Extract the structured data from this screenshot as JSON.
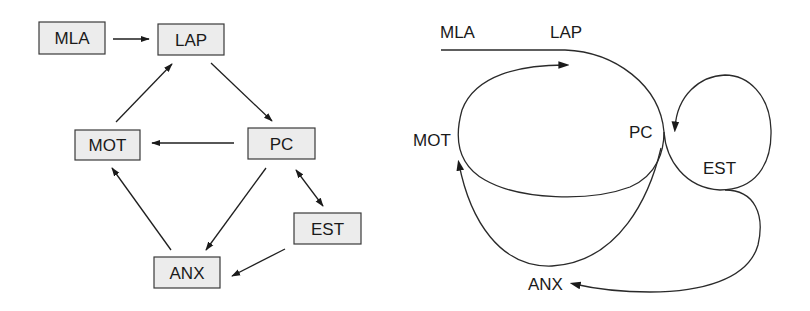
{
  "left_diagram": {
    "nodes": [
      {
        "id": "MLA",
        "label": "MLA"
      },
      {
        "id": "LAP",
        "label": "LAP"
      },
      {
        "id": "MOT",
        "label": "MOT"
      },
      {
        "id": "PC",
        "label": "PC"
      },
      {
        "id": "EST",
        "label": "EST"
      },
      {
        "id": "ANX",
        "label": "ANX"
      }
    ],
    "edges": [
      {
        "from": "MLA",
        "to": "LAP",
        "direction": "forward"
      },
      {
        "from": "LAP",
        "to": "PC",
        "direction": "forward"
      },
      {
        "from": "PC",
        "to": "MOT",
        "direction": "forward"
      },
      {
        "from": "MOT",
        "to": "LAP",
        "direction": "forward"
      },
      {
        "from": "PC",
        "to": "ANX",
        "direction": "forward"
      },
      {
        "from": "ANX",
        "to": "MOT",
        "direction": "forward"
      },
      {
        "from": "PC",
        "to": "EST",
        "direction": "bidirectional"
      },
      {
        "from": "EST",
        "to": "ANX",
        "direction": "forward"
      }
    ]
  },
  "right_diagram": {
    "labels": [
      {
        "id": "MLA",
        "label": "MLA"
      },
      {
        "id": "LAP",
        "label": "LAP"
      },
      {
        "id": "MOT",
        "label": "MOT"
      },
      {
        "id": "PC",
        "label": "PC"
      },
      {
        "id": "EST",
        "label": "EST"
      },
      {
        "id": "ANX",
        "label": "ANX"
      }
    ],
    "paths": [
      {
        "id": "mla-lap-pc",
        "description": "MLA through LAP curving into PC"
      },
      {
        "id": "pc-mot-lap-loop",
        "description": "Loop from PC under through MOT up to LAP (arrow)"
      },
      {
        "id": "pc-est-loop",
        "description": "Loop from PC around EST back to PC (arrow)"
      },
      {
        "id": "pc-anx-mot",
        "description": "PC down through ANX up to MOT (arrow)"
      },
      {
        "id": "est-anx",
        "description": "EST down and around to ANX (arrow)"
      }
    ]
  }
}
